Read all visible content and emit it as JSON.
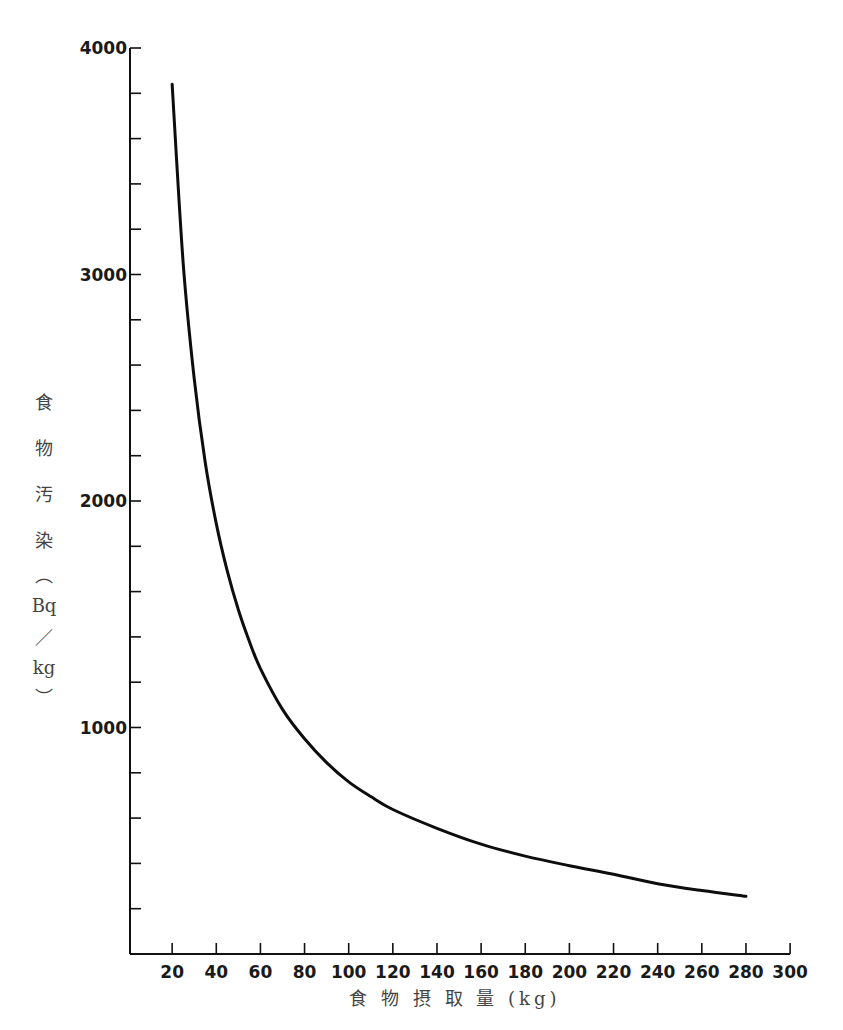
{
  "chart_data": {
    "type": "line",
    "title": "",
    "xlabel": "食 物 摂 取 量 (kg)",
    "ylabel_chars": [
      "食",
      "物",
      "汚",
      "染",
      "︵",
      "Bq",
      "／",
      "kg",
      "︶"
    ],
    "ylabel": "食物汚染 (Bq/kg)",
    "xlim": [
      0,
      300
    ],
    "ylim": [
      0,
      4000
    ],
    "x_ticks": [
      20,
      40,
      60,
      80,
      100,
      120,
      140,
      160,
      180,
      200,
      220,
      240,
      260,
      280,
      300
    ],
    "x_tick_labels": [
      "20",
      "40",
      "60",
      "80",
      "100",
      "120",
      "140",
      "160",
      "180",
      "200",
      "220",
      "240",
      "260",
      "280",
      "300"
    ],
    "y_ticks": [
      200,
      400,
      600,
      800,
      1000,
      1200,
      1400,
      1600,
      1800,
      2000,
      2200,
      2400,
      2600,
      2800,
      3000,
      3200,
      3400,
      3600,
      3800,
      4000
    ],
    "y_tick_labels": {
      "1000": "1000",
      "2000": "2000",
      "3000": "3000",
      "4000": "4000"
    },
    "grid": false,
    "legend": "none",
    "series": [
      {
        "name": "食物汚染",
        "x": [
          20,
          25,
          30,
          35,
          40,
          45,
          50,
          55,
          60,
          70,
          80,
          90,
          100,
          110,
          120,
          140,
          160,
          180,
          200,
          220,
          240,
          260,
          280
        ],
        "values": [
          3840,
          3050,
          2540,
          2170,
          1900,
          1690,
          1520,
          1380,
          1260,
          1080,
          950,
          845,
          760,
          695,
          638,
          555,
          485,
          432,
          390,
          352,
          310,
          280,
          255
        ]
      }
    ]
  }
}
